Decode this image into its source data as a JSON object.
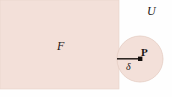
{
  "figure": {
    "caption_labels": {
      "universe_label": "U",
      "set_label": "F",
      "point_label": "P",
      "radius_label": "δ"
    },
    "colors": {
      "shade_fill": "#f3e0d9",
      "shade_stroke": "#e6cfc6",
      "ink": "#1c1715",
      "background": "#fefefe"
    },
    "geometry": {
      "rectangle": {
        "x": 0,
        "y": 0,
        "width": 119,
        "height": 89
      },
      "circle": {
        "cx": 140,
        "cy": 59,
        "r": 23
      },
      "radius_segment": {
        "x1": 117,
        "y1": 59,
        "x2": 140,
        "y2": 59
      },
      "point_marker": {
        "cx": 140,
        "cy": 59,
        "size": 4
      }
    }
  }
}
